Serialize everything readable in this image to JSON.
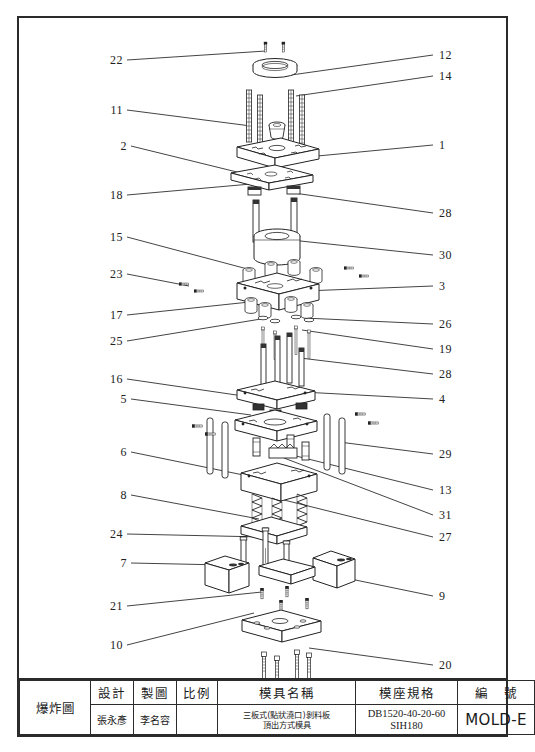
{
  "drawing": {
    "type": "exploded-assembly-view",
    "description": "Exploded isometric view of a three-plate injection mold assembly",
    "callouts_left": [
      {
        "n": "22",
        "x": 104,
        "y": 42,
        "tx": 247,
        "ty": 33
      },
      {
        "n": "11",
        "x": 104,
        "y": 92,
        "tx": 232,
        "ty": 108
      },
      {
        "n": "2",
        "x": 108,
        "y": 128,
        "tx": 222,
        "ty": 155
      },
      {
        "n": "18",
        "x": 104,
        "y": 177,
        "tx": 232,
        "ty": 166
      },
      {
        "n": "15",
        "x": 104,
        "y": 219,
        "tx": 236,
        "ty": 253
      },
      {
        "n": "23",
        "x": 104,
        "y": 256,
        "tx": 170,
        "ty": 268
      },
      {
        "n": "17",
        "x": 104,
        "y": 297,
        "tx": 240,
        "ty": 283
      },
      {
        "n": "25",
        "x": 104,
        "y": 323,
        "tx": 248,
        "ty": 300
      },
      {
        "n": "16",
        "x": 104,
        "y": 361,
        "tx": 238,
        "ty": 380
      },
      {
        "n": "5",
        "x": 108,
        "y": 381,
        "tx": 232,
        "ty": 397
      },
      {
        "n": "6",
        "x": 108,
        "y": 434,
        "tx": 239,
        "ty": 460
      },
      {
        "n": "8",
        "x": 108,
        "y": 477,
        "tx": 240,
        "ty": 501
      },
      {
        "n": "24",
        "x": 104,
        "y": 516,
        "tx": 244,
        "ty": 519
      },
      {
        "n": "7",
        "x": 108,
        "y": 545,
        "tx": 205,
        "ty": 547
      },
      {
        "n": "21",
        "x": 104,
        "y": 588,
        "tx": 243,
        "ty": 574
      },
      {
        "n": "10",
        "x": 104,
        "y": 627,
        "tx": 235,
        "ty": 595
      }
    ],
    "callouts_right": [
      {
        "n": "12",
        "x": 420,
        "y": 37,
        "tx": 272,
        "ty": 57
      },
      {
        "n": "14",
        "x": 420,
        "y": 58,
        "tx": 277,
        "ty": 78
      },
      {
        "n": "1",
        "x": 420,
        "y": 127,
        "tx": 288,
        "ty": 139
      },
      {
        "n": "28",
        "x": 420,
        "y": 195,
        "tx": 275,
        "ty": 175
      },
      {
        "n": "30",
        "x": 420,
        "y": 237,
        "tx": 272,
        "ty": 222
      },
      {
        "n": "3",
        "x": 420,
        "y": 268,
        "tx": 285,
        "ty": 273
      },
      {
        "n": "26",
        "x": 420,
        "y": 306,
        "tx": 285,
        "ty": 300
      },
      {
        "n": "19",
        "x": 420,
        "y": 331,
        "tx": 283,
        "ty": 312
      },
      {
        "n": "28",
        "x": 420,
        "y": 356,
        "tx": 281,
        "ty": 340
      },
      {
        "n": "4",
        "x": 420,
        "y": 381,
        "tx": 283,
        "ty": 374
      },
      {
        "n": "29",
        "x": 420,
        "y": 436,
        "tx": 320,
        "ty": 424
      },
      {
        "n": "13",
        "x": 420,
        "y": 472,
        "tx": 273,
        "ty": 437
      },
      {
        "n": "31",
        "x": 420,
        "y": 497,
        "tx": 265,
        "ty": 440
      },
      {
        "n": "27",
        "x": 420,
        "y": 519,
        "tx": 265,
        "ty": 482
      },
      {
        "n": "9",
        "x": 420,
        "y": 578,
        "tx": 283,
        "ty": 551
      },
      {
        "n": "20",
        "x": 420,
        "y": 647,
        "tx": 290,
        "ty": 630
      }
    ]
  },
  "title_block": {
    "view_label": "爆炸圖",
    "columns": [
      {
        "header": "設計",
        "value": "張永彥"
      },
      {
        "header": "製圖",
        "value": "李名容"
      },
      {
        "header": "比例",
        "value": ""
      },
      {
        "header": "模具名稱",
        "value_line1": "三板式(點狀澆口)剝料板",
        "value_line2": "頂出方式模具"
      },
      {
        "header": "模座規格",
        "value_line1": "DB1520-40-20-60",
        "value_line2": "SIH180"
      },
      {
        "header": "編  號",
        "value": "MOLD-E"
      }
    ]
  }
}
